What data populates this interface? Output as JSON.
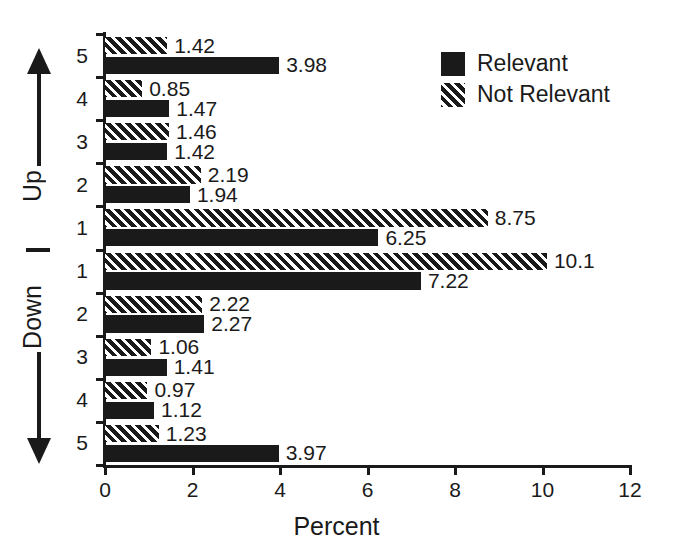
{
  "chart_data": {
    "type": "bar",
    "orientation": "horizontal",
    "title": "",
    "xlabel": "Percent",
    "ylabel": "",
    "xlim": [
      0,
      12
    ],
    "xticks": [
      0,
      2,
      4,
      6,
      8,
      10,
      12
    ],
    "xtick_labels": [
      "0",
      "2",
      "4",
      "6",
      "8",
      "10",
      "12"
    ],
    "grid": false,
    "legend_position": "top-right",
    "categories": [
      "5",
      "4",
      "3",
      "2",
      "1",
      "1",
      "2",
      "3",
      "4",
      "5"
    ],
    "category_groups": [
      {
        "name": "Up",
        "direction": "up",
        "labels": [
          "5",
          "4",
          "3",
          "2",
          "1"
        ]
      },
      {
        "name": "Down",
        "direction": "down",
        "labels": [
          "1",
          "2",
          "3",
          "4",
          "5"
        ]
      }
    ],
    "series": [
      {
        "name": "Not Relevant",
        "pattern": "hatched",
        "color": "#1a1a1a",
        "values": [
          1.42,
          0.85,
          1.46,
          2.19,
          8.75,
          10.1,
          2.22,
          1.06,
          0.97,
          1.23
        ],
        "value_labels": [
          "1.42",
          "0.85",
          "1.46",
          "2.19",
          "8.75",
          "10.1",
          "2.22",
          "1.06",
          "0.97",
          "1.23"
        ]
      },
      {
        "name": "Relevant",
        "pattern": "solid",
        "color": "#1a1a1a",
        "values": [
          3.98,
          1.47,
          1.42,
          1.94,
          6.25,
          7.22,
          2.27,
          1.41,
          1.12,
          3.97
        ],
        "value_labels": [
          "3.98",
          "1.47",
          "1.42",
          "1.94",
          "6.25",
          "7.22",
          "2.27",
          "1.41",
          "1.12",
          "3.97"
        ]
      }
    ]
  },
  "legend": {
    "items": [
      {
        "label": "Relevant",
        "pattern": "solid"
      },
      {
        "label": "Not Relevant",
        "pattern": "hatched"
      }
    ]
  },
  "axis_titles": {
    "x": "Percent",
    "up": "Up",
    "down": "Down"
  },
  "colors": {
    "ink": "#1a1a1a",
    "background": "#ffffff"
  }
}
